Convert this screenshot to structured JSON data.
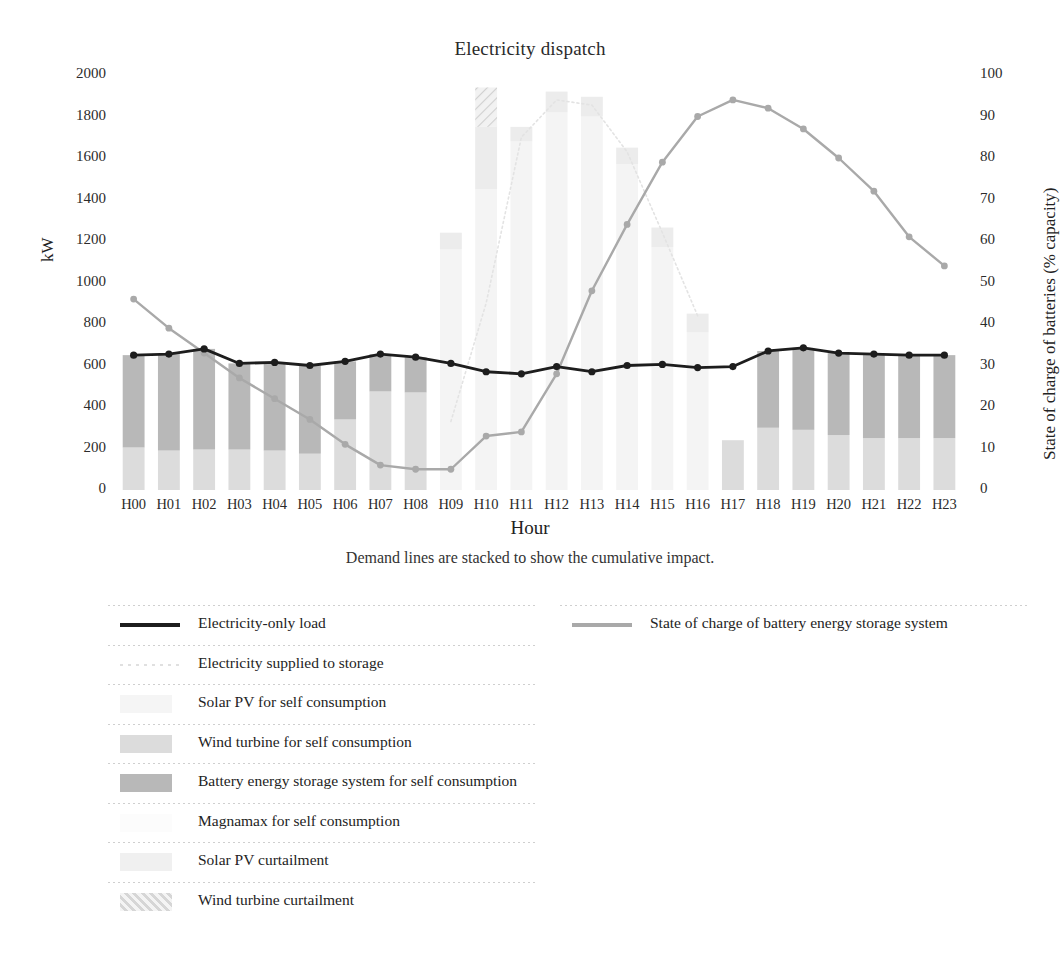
{
  "chart_data": {
    "type": "bar",
    "title": "Electricity dispatch",
    "subtitle": "Demand lines are stacked to show the cumulative impact.",
    "xlabel": "Hour",
    "ylabel": "kW",
    "y2label": "State of charge of batteries (% capacity)",
    "grid": false,
    "legend_position": "bottom",
    "ylim": [
      0,
      2000
    ],
    "y2lim": [
      0,
      100
    ],
    "categories": [
      "H00",
      "H01",
      "H02",
      "H03",
      "H04",
      "H05",
      "H06",
      "H07",
      "H08",
      "H09",
      "H10",
      "H11",
      "H12",
      "H13",
      "H14",
      "H15",
      "H16",
      "H17",
      "H18",
      "H19",
      "H20",
      "H21",
      "H22",
      "H23"
    ],
    "ytick_labels": [
      "0",
      "200",
      "400",
      "600",
      "800",
      "1000",
      "1200",
      "1400",
      "1600",
      "1800",
      "2000"
    ],
    "ytick_values": [
      0,
      200,
      400,
      600,
      800,
      1000,
      1200,
      1400,
      1600,
      1800,
      2000
    ],
    "y2tick_labels": [
      "0",
      "10",
      "20",
      "30",
      "40",
      "50",
      "60",
      "70",
      "80",
      "90",
      "100"
    ],
    "y2tick_values": [
      0,
      10,
      20,
      30,
      40,
      50,
      60,
      70,
      80,
      90,
      100
    ],
    "series": [
      {
        "name": "Electricity-only load",
        "kind": "line",
        "axis": "left",
        "color": "#1d1d1d",
        "values": [
          650,
          655,
          680,
          610,
          615,
          600,
          620,
          655,
          640,
          610,
          570,
          560,
          595,
          570,
          600,
          605,
          590,
          595,
          670,
          685,
          660,
          655,
          650,
          650
        ]
      },
      {
        "name": "State of charge of battery energy storage system",
        "kind": "line",
        "axis": "right",
        "color": "#a9a9a9",
        "values": [
          46,
          39,
          33,
          27,
          22,
          17,
          11,
          6,
          5,
          5,
          13,
          14,
          28,
          48,
          64,
          79,
          90,
          94,
          92,
          87,
          80,
          72,
          61,
          54
        ]
      },
      {
        "name": "Electricity supplied to storage",
        "kind": "dotted-line",
        "axis": "left",
        "color": "#e3e3e3",
        "values": [
          0,
          0,
          0,
          0,
          0,
          0,
          0,
          0,
          0,
          330,
          900,
          1700,
          1880,
          1855,
          1630,
          1240,
          840,
          0,
          0,
          0,
          0,
          0,
          0,
          0
        ]
      },
      {
        "name": "Solar PV for self consumption",
        "kind": "bar",
        "axis": "left",
        "color": "#f4f4f4",
        "values": [
          0,
          0,
          0,
          0,
          0,
          0,
          0,
          0,
          0,
          1160,
          1450,
          1680,
          1820,
          1800,
          1570,
          1170,
          760,
          0,
          0,
          0,
          0,
          0,
          0,
          0
        ]
      },
      {
        "name": "Wind turbine for self consumption",
        "kind": "bar",
        "axis": "left",
        "color": "#dcdcdc",
        "values": [
          205,
          190,
          195,
          195,
          190,
          175,
          340,
          475,
          470,
          0,
          0,
          0,
          0,
          0,
          0,
          0,
          0,
          240,
          300,
          290,
          265,
          250,
          250,
          250
        ]
      },
      {
        "name": "Battery energy storage system for self consumption",
        "kind": "bar",
        "axis": "left",
        "color": "#b8b8b8",
        "values": [
          445,
          465,
          485,
          415,
          425,
          425,
          280,
          180,
          170,
          0,
          0,
          0,
          0,
          0,
          0,
          0,
          0,
          0,
          370,
          395,
          395,
          405,
          400,
          400
        ]
      },
      {
        "name": "Magnamax for self consumption",
        "kind": "bar",
        "axis": "left",
        "color": "#fbfbfb",
        "values": [
          0,
          0,
          0,
          0,
          0,
          0,
          0,
          0,
          0,
          0,
          0,
          0,
          0,
          0,
          0,
          0,
          0,
          0,
          0,
          0,
          0,
          0,
          0,
          0
        ]
      },
      {
        "name": "Solar PV curtailment",
        "kind": "bar",
        "axis": "left",
        "color": "#ececec",
        "values": [
          0,
          0,
          0,
          0,
          0,
          0,
          0,
          0,
          0,
          80,
          300,
          70,
          100,
          95,
          80,
          95,
          90,
          0,
          0,
          0,
          0,
          0,
          0,
          0
        ]
      },
      {
        "name": "Wind turbine curtailment",
        "kind": "bar-hatch",
        "axis": "left",
        "color": "#e0e0e0",
        "values": [
          0,
          0,
          0,
          0,
          0,
          0,
          0,
          0,
          0,
          0,
          190,
          0,
          0,
          0,
          0,
          0,
          0,
          0,
          0,
          0,
          0,
          0,
          0,
          0
        ]
      }
    ],
    "legend_left": [
      {
        "label": "Electricity-only load",
        "swatch": "line-solid-dark"
      },
      {
        "label": "Electricity supplied to storage",
        "swatch": "line-dotted-faint"
      },
      {
        "label": "Solar PV for self consumption",
        "swatch": "box-solar"
      },
      {
        "label": "Wind turbine for self consumption",
        "swatch": "box-wind"
      },
      {
        "label": "Battery energy storage system for self consumption",
        "swatch": "box-bess"
      },
      {
        "label": "Magnamax for self consumption",
        "swatch": "box-magnamax"
      },
      {
        "label": "Solar PV curtailment",
        "swatch": "box-solar-curtail"
      },
      {
        "label": "Wind turbine curtailment",
        "swatch": "box-wind-curtail-hatch"
      }
    ],
    "legend_right": [
      {
        "label": "State of charge of battery energy storage system",
        "swatch": "line-solid-gray"
      }
    ]
  }
}
